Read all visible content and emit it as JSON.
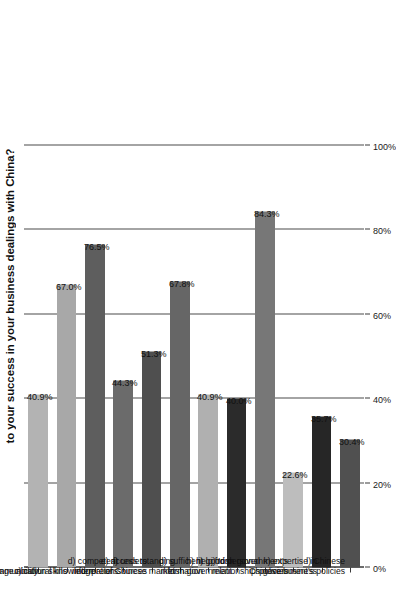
{
  "chart_data": {
    "type": "bar",
    "orientation": "vertical-rotated",
    "title": "to your success in your business dealings with China?",
    "xlabel": "",
    "ylabel": "",
    "ylim": [
      0,
      100
    ],
    "grid": true,
    "legend": "none",
    "categories": [
      "a) language ability",
      "b) communication skills",
      "c) cultural knowledge",
      "d) competent\ninterpreters",
      "e) access to\ninformation sources",
      "f) understanding\nof Chinese market",
      "g) sufficient\ninformation",
      "h) help from\nIrish government",
      "i) good personal\nrelationships",
      "j) Irish government's\npolicies",
      "k) expertise in\nChinese business",
      "l) Chinese\ngovernment's policies"
    ],
    "values": [
      40.9,
      67.0,
      76.5,
      44.3,
      51.3,
      67.8,
      40.9,
      40.0,
      84.3,
      22.6,
      35.7,
      30.4
    ],
    "value_labels": [
      "40.9%",
      "67.0%",
      "76.5%",
      "44.3%",
      "51.3%",
      "67.8%",
      "40.9%",
      "40.0%",
      "84.3%",
      "22.6%",
      "35.7%",
      "30.4%"
    ],
    "bar_colors": [
      "#b3b3b3",
      "#a8a8a8",
      "#5e5e5e",
      "#6b6b6b",
      "#4f4f4f",
      "#666666",
      "#b0b0b0",
      "#2b2b2b",
      "#777777",
      "#bdbdbd",
      "#262626",
      "#505050"
    ],
    "tick_values": [
      0,
      20,
      40,
      60,
      80,
      100
    ],
    "tick_labels": [
      "0%",
      "20%",
      "40%",
      "60%",
      "80%",
      "100%"
    ],
    "axis_color": "#3a3a3a",
    "grid_color": "#4a4a4a",
    "background": "#ffffff"
  }
}
